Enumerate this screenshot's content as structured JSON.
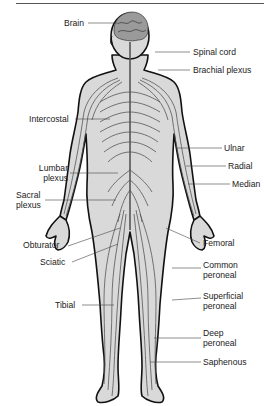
{
  "figure": {
    "skin_color": "#d9d9d9",
    "outline_color": "#111111",
    "nerve_color": "#555555",
    "leader_color": "#444444"
  },
  "labels": {
    "brain": "Brain",
    "spinal_cord": "Spinal cord",
    "brachial_plexus": "Brachial plexus",
    "intercostal": "Intercostal",
    "ulnar": "Ulnar",
    "radial": "Radial",
    "median": "Median",
    "lumbar_plexus_1": "Lumbar",
    "lumbar_plexus_2": "plexus",
    "sacral_plexus_1": "Sacral",
    "sacral_plexus_2": "plexus",
    "obturator": "Obturator",
    "femoral": "Femoral",
    "sciatic": "Sciatic",
    "common_peroneal_1": "Common",
    "common_peroneal_2": "peroneal",
    "superficial_peroneal_1": "Superficial",
    "superficial_peroneal_2": "peroneal",
    "deep_peroneal_1": "Deep",
    "deep_peroneal_2": "peroneal",
    "tibial": "Tibial",
    "saphenous": "Saphenous"
  }
}
